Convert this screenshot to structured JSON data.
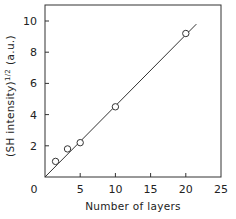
{
  "chart_data": {
    "type": "scatter",
    "title": "",
    "xlabel": "Number of layers",
    "ylabel": "(SH intensity)",
    "ylabel_superscript": "1/2",
    "ylabel_units": "(a.u.)",
    "xlim": [
      0,
      25
    ],
    "ylim": [
      0,
      11
    ],
    "x_ticks": [
      0,
      5,
      10,
      15,
      20,
      25
    ],
    "y_ticks": [
      0,
      2,
      4,
      6,
      8,
      10
    ],
    "x_tick_labels": [
      "0",
      "5",
      "10",
      "15",
      "20",
      "25"
    ],
    "y_tick_labels": [
      "2",
      "4",
      "6",
      "8",
      "10"
    ],
    "grid": false,
    "legend": null,
    "series": [
      {
        "name": "measured",
        "marker": "open-circle",
        "x": [
          1.5,
          3.2,
          5,
          10,
          20
        ],
        "y": [
          1.0,
          1.8,
          2.2,
          4.5,
          9.2
        ]
      },
      {
        "name": "linear fit",
        "style": "line",
        "x": [
          0,
          21.5
        ],
        "y": [
          0,
          9.8
        ]
      }
    ]
  }
}
